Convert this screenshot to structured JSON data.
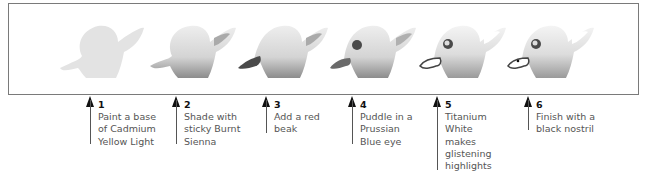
{
  "colors": {
    "frame": "#7a7a7a",
    "duck_light": "#e6e6e6",
    "duck_shade": "#9a9a9a",
    "beak_dark": "#555555",
    "eye": "#4a4a4a",
    "arrow": "#111111",
    "text": "#555555"
  },
  "steps": [
    {
      "num": "1",
      "text": "Paint a base\nof Cadmium\nYellow Light",
      "x": 90
    },
    {
      "num": "2",
      "text": "Shade with\nsticky Burnt\nSienna",
      "x": 176
    },
    {
      "num": "3",
      "text": "Add a red\nbeak",
      "x": 266
    },
    {
      "num": "4",
      "text": "Puddle in a\nPrussian\nBlue eye",
      "x": 352
    },
    {
      "num": "5",
      "text": "Titanium\nWhite\nmakes\nglistening\nhighlights",
      "x": 437
    },
    {
      "num": "6",
      "text": "Finish with a\nblack nostril",
      "x": 528
    }
  ],
  "illustrations": [
    {
      "name": "duck-stage-1-base"
    },
    {
      "name": "duck-stage-2-shaded"
    },
    {
      "name": "duck-stage-3-beak"
    },
    {
      "name": "duck-stage-4-eye"
    },
    {
      "name": "duck-stage-5-highlights"
    },
    {
      "name": "duck-stage-6-nostril"
    }
  ]
}
